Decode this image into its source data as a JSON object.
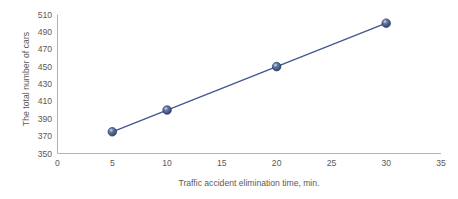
{
  "chart_data": {
    "type": "line",
    "title": "",
    "subtitle": "",
    "xlabel": "Traffic accident elimination time, min.",
    "ylabel": "The total number of cars",
    "x": [
      5,
      10,
      20,
      30
    ],
    "values": [
      375,
      400,
      450,
      500
    ],
    "series": [
      {
        "name": "The total number of cars",
        "x": [
          5,
          10,
          20,
          30
        ],
        "values": [
          375,
          400,
          450,
          500
        ]
      }
    ],
    "xlim": [
      0,
      35
    ],
    "ylim": [
      350,
      510
    ],
    "xticks": [
      "0",
      "5",
      "10",
      "15",
      "20",
      "25",
      "30",
      "35"
    ],
    "yticks": [
      "350",
      "370",
      "390",
      "410",
      "430",
      "450",
      "470",
      "490",
      "510"
    ],
    "xtick_values": [
      0,
      5,
      10,
      15,
      20,
      25,
      30,
      35
    ],
    "ytick_values": [
      350,
      370,
      390,
      410,
      430,
      450,
      470,
      490,
      510
    ],
    "grid": false,
    "legend": false,
    "legend_position": "none",
    "annotations": [],
    "colors": {
      "line": "#41588f",
      "marker_fill": "#41588f",
      "marker_highlight": "#8e9fc4",
      "marker_edge": "#2b3b63",
      "axis": "#a8b6cc",
      "tick_text": "#595959",
      "axis_title_text": "#5a5a5a",
      "background": "#ffffff"
    },
    "marker": "circle-3d-sphere",
    "line_width": 1.4
  }
}
